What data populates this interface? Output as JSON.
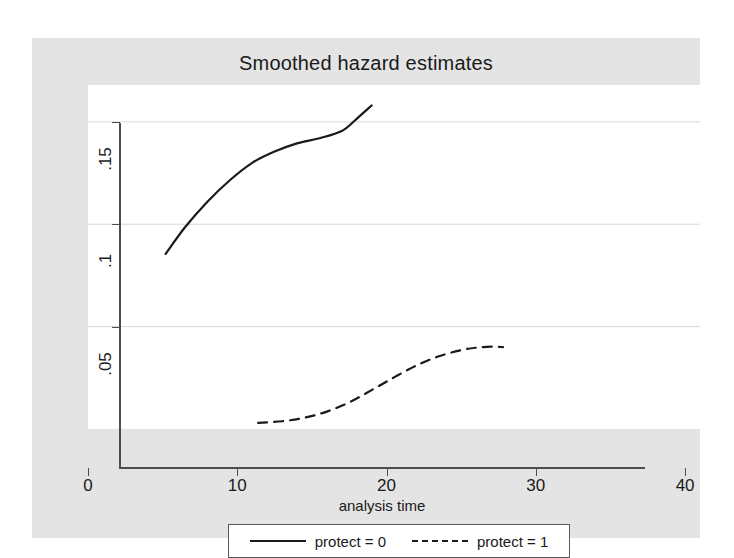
{
  "chart_data": {
    "type": "line",
    "title": "Smoothed hazard estimates",
    "xlabel": "analysis time",
    "ylabel": "",
    "xlim": [
      0,
      41
    ],
    "ylim": [
      0,
      0.168
    ],
    "xticks": [
      "0",
      "10",
      "20",
      "30",
      "40"
    ],
    "xtick_values": [
      0,
      10,
      20,
      30,
      40
    ],
    "yticks": [
      ".05",
      ".1",
      ".15"
    ],
    "ytick_values": [
      0.05,
      0.1,
      0.15
    ],
    "grid": "horizontal",
    "legend_position": "bottom",
    "series": [
      {
        "name": "protect = 0",
        "style": "solid",
        "color": "#1a1a1a",
        "x": [
          5.2,
          6.5,
          8.0,
          9.5,
          11.0,
          12.5,
          14.0,
          15.5,
          17.0,
          18.0,
          19.0
        ],
        "y": [
          0.0855,
          0.0985,
          0.111,
          0.1215,
          0.13,
          0.1355,
          0.1395,
          0.142,
          0.1455,
          0.1515,
          0.158
        ]
      },
      {
        "name": "protect = 1",
        "style": "dashed",
        "color": "#1a1a1a",
        "x": [
          11.4,
          13.0,
          14.5,
          16.0,
          17.5,
          19.0,
          20.5,
          22.0,
          23.5,
          25.0,
          26.0,
          27.0,
          27.8
        ],
        "y": [
          0.003,
          0.0038,
          0.0055,
          0.0085,
          0.013,
          0.019,
          0.0252,
          0.031,
          0.0355,
          0.0385,
          0.0397,
          0.0402,
          0.04
        ]
      }
    ]
  },
  "legend": {
    "entries": [
      {
        "label": "protect = 0",
        "style": "solid"
      },
      {
        "label": "protect = 1",
        "style": "dashed"
      }
    ]
  }
}
